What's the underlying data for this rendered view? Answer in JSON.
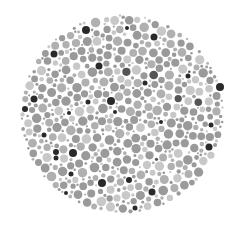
{
  "plate": {
    "type": "ishihara-style dot plate (grayscale)",
    "center": [
      122,
      114
    ],
    "radius_x": 102,
    "radius_y": 100,
    "background": "#ffffff",
    "palette": {
      "light": "#c8c8c8",
      "mid": "#9a9a9a",
      "midlight": "#b0b0b0",
      "dark": "#2a2a2a"
    },
    "dark_dots": [
      [
        86,
        30,
        4
      ],
      [
        154,
        37,
        3.5
      ],
      [
        54,
        54,
        3.5
      ],
      [
        99,
        66,
        3.5
      ],
      [
        220,
        87,
        4
      ],
      [
        34,
        99,
        3.5
      ],
      [
        111,
        101,
        4
      ],
      [
        25,
        109,
        3
      ],
      [
        88,
        102,
        2.5
      ],
      [
        69,
        113,
        2
      ],
      [
        161,
        122,
        2
      ],
      [
        211,
        125,
        2.5
      ],
      [
        44,
        135,
        2.5
      ],
      [
        209,
        147,
        3.5
      ],
      [
        56,
        152,
        3
      ],
      [
        73,
        153,
        4
      ],
      [
        56,
        158,
        2.5
      ],
      [
        71,
        174,
        2.5
      ],
      [
        102,
        183,
        4
      ],
      [
        129,
        180,
        3
      ],
      [
        152,
        192,
        3.5
      ],
      [
        135,
        208,
        2.5
      ],
      [
        115,
        112,
        2
      ],
      [
        145,
        83,
        2.5
      ],
      [
        127,
        28,
        2
      ],
      [
        188,
        76,
        2.5
      ],
      [
        66,
        193,
        2
      ]
    ]
  }
}
